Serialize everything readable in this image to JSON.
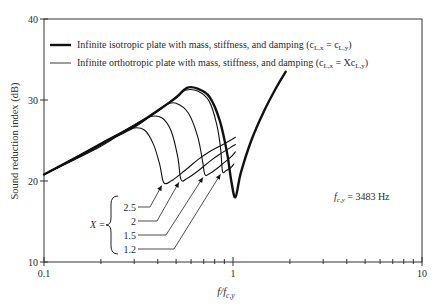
{
  "chart_data": {
    "type": "line",
    "title": "",
    "xlabel": "f/f",
    "xlabel_sub": "c,y",
    "ylabel": "Sound reduction index (dB)",
    "xscale": "log",
    "xlim": [
      0.1,
      10
    ],
    "ylim": [
      10,
      40
    ],
    "grid": false,
    "legend_position": "top-left",
    "x_ticks": [
      0.1,
      1,
      10
    ],
    "x_tick_labels": [
      "0.1",
      "1",
      "10"
    ],
    "y_ticks": [
      10,
      20,
      30,
      40
    ],
    "y_tick_labels": [
      "10",
      "20",
      "30",
      "40"
    ],
    "legend": [
      {
        "label": "Infinite isotropic plate with mass, stiffness, and damping (c",
        "sub1": "L,x",
        "mid": " = c",
        "sub2": "L,y",
        "end": ")",
        "style": "thick"
      },
      {
        "label": "Infinite orthotropic plate with mass, stiffness, and damping (c",
        "sub1": "L,x",
        "mid": " = Xc",
        "sub2": "L,y",
        "end": ")",
        "style": "thin"
      }
    ],
    "series": [
      {
        "name": "Isotropic",
        "style": "thick",
        "x": [
          0.1,
          0.15,
          0.2,
          0.3,
          0.4,
          0.5,
          0.57,
          0.65,
          0.75,
          0.85,
          0.93,
          0.98,
          1.03,
          1.1,
          1.25,
          1.45,
          1.7,
          1.9
        ],
        "y": [
          20.8,
          23.0,
          24.6,
          26.8,
          28.7,
          30.3,
          31.5,
          31.4,
          30.4,
          27.5,
          23.5,
          20.0,
          18.0,
          21.0,
          25.0,
          28.5,
          31.6,
          33.5
        ]
      },
      {
        "name": "X = 1.2",
        "style": "thin",
        "x": [
          0.1,
          0.2,
          0.3,
          0.4,
          0.5,
          0.56,
          0.65,
          0.75,
          0.82,
          0.86,
          0.88,
          0.92,
          0.97,
          1.01
        ],
        "y": [
          20.8,
          24.6,
          26.8,
          28.6,
          30.4,
          31.2,
          31.1,
          29.8,
          27.0,
          24.0,
          21.2,
          21.3,
          21.6,
          22.1
        ]
      },
      {
        "name": "X = 1.5",
        "style": "thin",
        "x": [
          0.1,
          0.2,
          0.3,
          0.38,
          0.44,
          0.5,
          0.58,
          0.65,
          0.69,
          0.71,
          0.75,
          0.82,
          0.9,
          0.98,
          1.03
        ],
        "y": [
          20.8,
          24.5,
          26.6,
          28.3,
          29.4,
          29.6,
          28.4,
          25.5,
          22.5,
          20.8,
          20.9,
          21.5,
          22.3,
          23.0,
          23.6
        ]
      },
      {
        "name": "X = 2",
        "style": "thin",
        "x": [
          0.1,
          0.2,
          0.28,
          0.36,
          0.42,
          0.47,
          0.51,
          0.53,
          0.57,
          0.65,
          0.75,
          0.85,
          0.95,
          1.03
        ],
        "y": [
          20.8,
          24.3,
          26.5,
          27.9,
          27.8,
          26.2,
          23.0,
          20.2,
          20.3,
          21.2,
          22.4,
          23.3,
          24.0,
          24.5
        ]
      },
      {
        "name": "X = 2.5",
        "style": "thin",
        "x": [
          0.1,
          0.18,
          0.24,
          0.29,
          0.34,
          0.38,
          0.41,
          0.43,
          0.47,
          0.55,
          0.65,
          0.75,
          0.85,
          0.95,
          1.03
        ],
        "y": [
          20.8,
          23.8,
          25.6,
          26.5,
          26.3,
          24.5,
          22.0,
          19.8,
          20.0,
          21.2,
          22.6,
          23.6,
          24.3,
          24.9,
          25.4
        ]
      }
    ],
    "annotations": {
      "fc": {
        "label": "f",
        "sub": "c,y",
        "value_text": " = 3483 Hz"
      },
      "x_bracket_label": "X =",
      "x_values": [
        "2.5",
        "2",
        "1.5",
        "1.2"
      ],
      "arrow_targets": [
        {
          "label": "2.5",
          "x": 0.43,
          "y": 19.8
        },
        {
          "label": "2",
          "x": 0.53,
          "y": 20.2
        },
        {
          "label": "1.5",
          "x": 0.71,
          "y": 20.8
        },
        {
          "label": "1.2",
          "x": 0.88,
          "y": 21.2
        }
      ]
    }
  }
}
